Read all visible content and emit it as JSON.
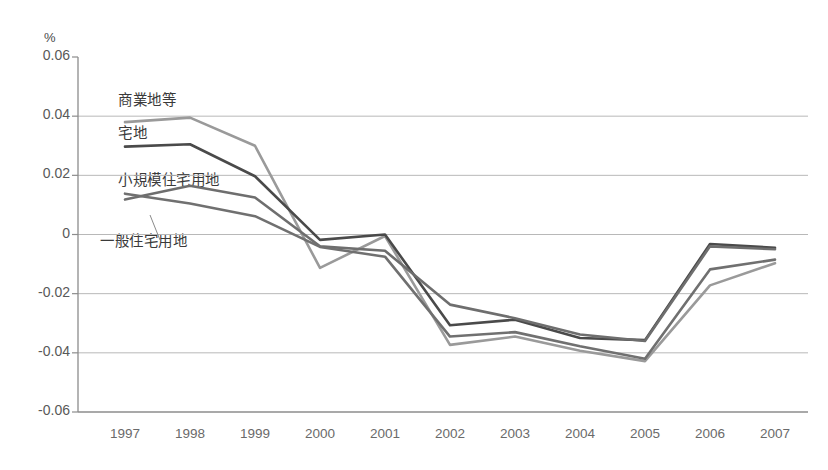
{
  "chart_data": {
    "type": "line",
    "title": "",
    "xlabel": "",
    "ylabel": "%",
    "unit_label": "%",
    "categories": [
      "1997",
      "1998",
      "1999",
      "2000",
      "2001",
      "2002",
      "2003",
      "2004",
      "2005",
      "2006",
      "2007"
    ],
    "ylim": [
      -0.06,
      0.06
    ],
    "ytick_labels": [
      "0.06",
      "0.04",
      "0.02",
      "0",
      "-0.02",
      "-0.04",
      "-0.06"
    ],
    "ytick_values": [
      0.06,
      0.04,
      0.02,
      0,
      -0.02,
      -0.04,
      -0.06
    ],
    "grid": true,
    "legend_position": "inline-annotations",
    "series": [
      {
        "name": "商業地等",
        "color": "#9a9a9a",
        "label_position": "top-left",
        "values": [
          0.038,
          0.0395,
          0.03,
          -0.0113,
          -0.0005,
          -0.0373,
          -0.0345,
          -0.0393,
          -0.0428,
          -0.0172,
          -0.0097
        ]
      },
      {
        "name": "宅地",
        "color": "#4a4a4a",
        "label_position": "upper-left",
        "values": [
          0.0297,
          0.0305,
          0.0197,
          -0.0018,
          0.0,
          -0.0307,
          -0.0288,
          -0.035,
          -0.0357,
          -0.0032,
          -0.0045
        ]
      },
      {
        "name": "小規模住宅用地",
        "color": "#6e6e6e",
        "label_position": "mid-left",
        "values": [
          0.0118,
          0.0165,
          0.0125,
          -0.004,
          -0.0055,
          -0.0237,
          -0.0283,
          -0.0338,
          -0.036,
          -0.004,
          -0.005
        ]
      },
      {
        "name": "一般住宅用地",
        "color": "#707070",
        "label_position": "lower-left",
        "values": [
          0.0138,
          0.0105,
          0.0062,
          -0.0042,
          -0.0075,
          -0.0345,
          -0.033,
          -0.0378,
          -0.042,
          -0.0118,
          -0.0085
        ]
      }
    ]
  },
  "axes": {
    "unit": "%",
    "y_tick_texts": [
      "0.06",
      "0.04",
      "0.02",
      "0",
      "-0.02",
      "-0.04",
      "-0.06"
    ],
    "x_tick_texts": [
      "1997",
      "1998",
      "1999",
      "2000",
      "2001",
      "2002",
      "2003",
      "2004",
      "2005",
      "2006",
      "2007"
    ]
  },
  "annotations": {
    "items": [
      {
        "text": "商業地等",
        "x": 118,
        "y": 88
      },
      {
        "text": "宅地",
        "x": 118,
        "y": 121
      },
      {
        "text": "小規模住宅用地",
        "x": 118,
        "y": 168
      },
      {
        "text": "一般住宅用地",
        "x": 100,
        "y": 229
      }
    ]
  },
  "style": {
    "plot_background": "#ffffff",
    "grid_color": "#b8b8b8",
    "axis_color": "#8c8c8c",
    "text_color": "#595959"
  }
}
